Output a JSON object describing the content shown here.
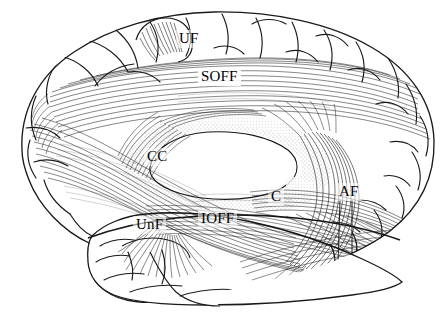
{
  "figure": {
    "type": "anatomical-line-drawing",
    "background_color": "#ffffff",
    "ink_color": "#1a1a1a",
    "width": 445,
    "height": 325
  },
  "labels": [
    {
      "id": "uf",
      "text": "UF",
      "full_name": "Uncinate fasciculus",
      "x": 176,
      "y": 30,
      "boxed": false
    },
    {
      "id": "soff",
      "text": "SOFF",
      "full_name": "Superior occipitofrontal fasciculus",
      "x": 198,
      "y": 68,
      "boxed": true
    },
    {
      "id": "cc",
      "text": "CC",
      "full_name": "Corpus callosum",
      "x": 144,
      "y": 148,
      "boxed": false
    },
    {
      "id": "unf",
      "text": "UnF",
      "full_name": "Uncinate fasciculus",
      "x": 133,
      "y": 216,
      "boxed": false
    },
    {
      "id": "ioff",
      "text": "IOFF",
      "full_name": "Inferior occipitofrontal fasciculus",
      "x": 198,
      "y": 210,
      "boxed": false
    },
    {
      "id": "c",
      "text": "C",
      "full_name": "Cingulum",
      "x": 268,
      "y": 188,
      "boxed": false
    },
    {
      "id": "af",
      "text": "AF",
      "full_name": "Arcuate fasciculus",
      "x": 336,
      "y": 183,
      "boxed": false
    }
  ],
  "regions": [
    {
      "id": "frontal-lobe",
      "name": "frontal-lobe"
    },
    {
      "id": "parietal-lobe",
      "name": "parietal-lobe"
    },
    {
      "id": "occipital-lobe",
      "name": "occipital-lobe"
    },
    {
      "id": "temporal-lobe",
      "name": "temporal-lobe"
    },
    {
      "id": "corpus-callosum-body",
      "name": "corpus-callosum-body"
    }
  ]
}
